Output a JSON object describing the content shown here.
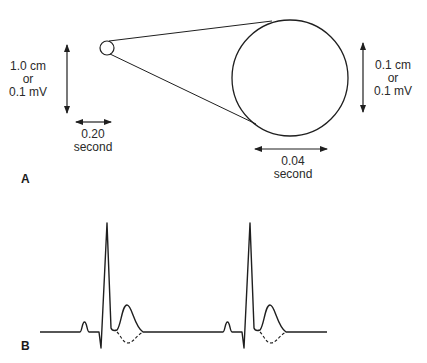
{
  "panel_a": {
    "label": "A",
    "large_box_scale": {
      "vertical": [
        "1.0 cm",
        "or",
        "0.1 mV"
      ],
      "horizontal": [
        "0.20",
        "second"
      ]
    },
    "small_box_scale": {
      "vertical": [
        "0.1 cm",
        "or",
        "0.1 mV"
      ],
      "horizontal": [
        "0.04",
        "second"
      ]
    }
  },
  "panel_b": {
    "label": "B",
    "waveform": "ECG",
    "complexes": 2,
    "components": [
      "P wave",
      "QRS complex",
      "T wave (upright, solid)",
      "T wave (inverted, dashed)"
    ]
  },
  "colors": {
    "line": "#1f1f1f",
    "text": "#2a2a2a",
    "background": "#ffffff"
  }
}
